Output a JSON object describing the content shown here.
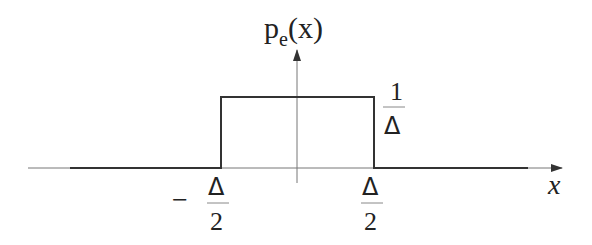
{
  "diagram": {
    "type": "uniform-pdf",
    "y_axis_label": {
      "main": "p",
      "subscript": "e",
      "argument": "(x)"
    },
    "x_axis_label": "x",
    "height_label": {
      "numerator": "1",
      "denominator": "Δ"
    },
    "left_bound_label": {
      "sign": "−",
      "numerator": "Δ",
      "denominator": "2"
    },
    "right_bound_label": {
      "numerator": "Δ",
      "denominator": "2"
    },
    "function": {
      "support": [
        "-Δ/2",
        "Δ/2"
      ],
      "value_inside": "1/Δ",
      "value_outside": 0
    },
    "colors": {
      "line": "#333333",
      "axis": "#555555",
      "text": "#222222",
      "background": "#ffffff"
    }
  }
}
